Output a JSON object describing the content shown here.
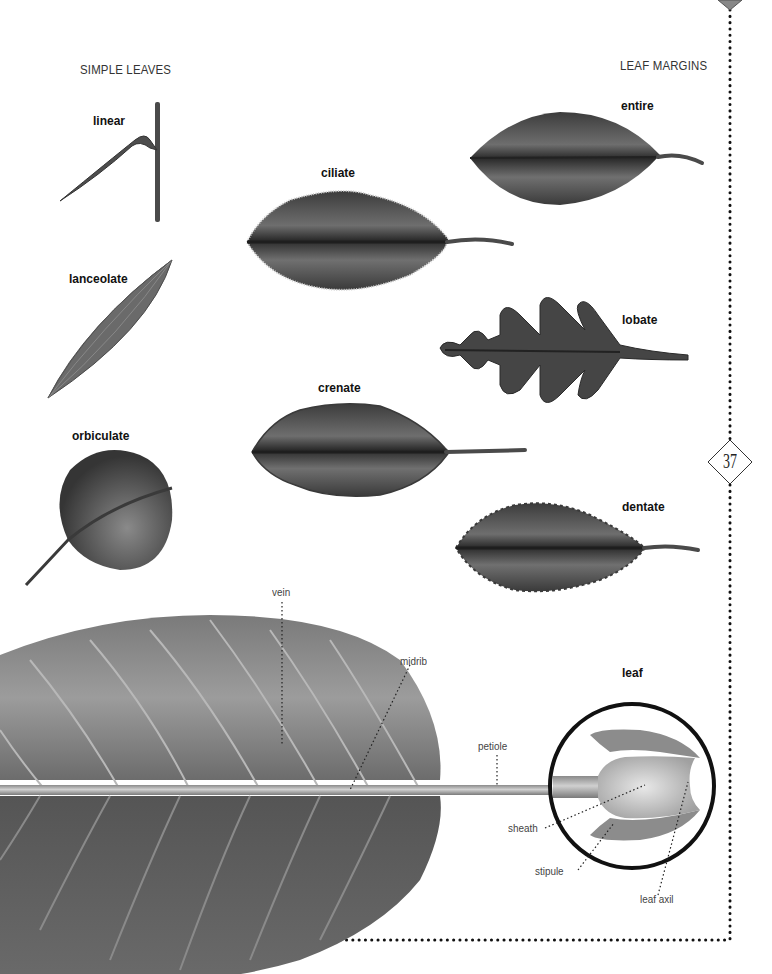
{
  "page": {
    "page_number": "37",
    "accent_color": "#000000",
    "border_style": "dotted"
  },
  "sections": {
    "simple_leaves": {
      "title": "SIMPLE LEAVES"
    },
    "leaf_margins": {
      "title": "LEAF MARGINS"
    },
    "leaf_anatomy": {
      "title": "leaf"
    }
  },
  "simple_leaves": [
    {
      "id": "linear",
      "label": "linear"
    },
    {
      "id": "lanceolate",
      "label": "lanceolate"
    },
    {
      "id": "orbiculate",
      "label": "orbiculate"
    }
  ],
  "leaf_margins": [
    {
      "id": "entire",
      "label": "entire"
    },
    {
      "id": "ciliate",
      "label": "ciliate"
    },
    {
      "id": "lobate",
      "label": "lobate"
    },
    {
      "id": "crenate",
      "label": "crenate"
    },
    {
      "id": "dentate",
      "label": "dentate"
    }
  ],
  "anatomy_callouts": {
    "vein": "vein",
    "midrib": "midrib",
    "petiole": "petiole",
    "sheath": "sheath",
    "stipule": "stipule",
    "leaf_axil": "leaf axil"
  },
  "colors": {
    "leaf_dark": "#3a3a3a",
    "leaf_mid": "#6a6a6a",
    "leaf_light": "#9a9a9a",
    "sheath_light": "#d8d8d8",
    "border": "#111111"
  }
}
